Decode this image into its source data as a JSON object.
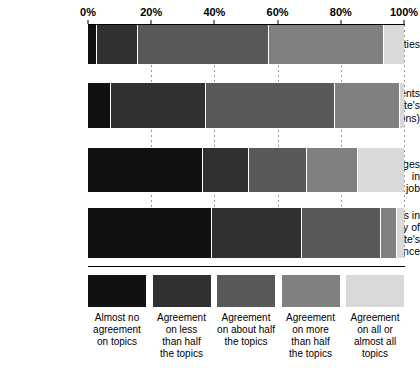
{
  "chart_data": {
    "type": "bar",
    "orientation": "horizontal",
    "stacked": true,
    "normalized_percent": true,
    "title": "",
    "xlabel": "",
    "ylabel": "",
    "xlim": [
      0,
      100
    ],
    "grid": true,
    "legend_position": "bottom",
    "x_tick_labels": [
      "0%",
      "20%",
      "40%",
      "60%",
      "80%",
      "100%"
    ],
    "x_tick_values": [
      0,
      20,
      40,
      60,
      80,
      100
    ],
    "categories": [
      "Job duties",
      "Job requirements (subordinate's qualifications)",
      "Future changes in subordinate's job",
      "Obstacles in the way of subordinate's performance"
    ],
    "category_lines": [
      [
        "Job duties"
      ],
      [
        "Job requirements",
        "(subordinate's",
        "qualifications)"
      ],
      [
        "Future changes in",
        "subordinate's job"
      ],
      [
        "Obstacles in",
        "the way of",
        "subordinate's",
        "performance"
      ]
    ],
    "series": [
      {
        "name": "Almost no agreement on topics",
        "color": "#111111",
        "values": [
          2.5,
          7.0,
          36.0,
          39.0
        ]
      },
      {
        "name": "Agreement on less than half the topics",
        "color": "#303030",
        "values": [
          13.0,
          30.0,
          14.5,
          28.5
        ]
      },
      {
        "name": "Agreement on about half the topics",
        "color": "#595959",
        "values": [
          41.5,
          41.0,
          18.5,
          25.0
        ]
      },
      {
        "name": "Agreement on more than half the topics",
        "color": "#808080",
        "values": [
          36.5,
          20.5,
          16.0,
          5.0
        ]
      },
      {
        "name": "Agreement on all or almost all topics",
        "color": "#d9d9d9",
        "values": [
          6.5,
          1.5,
          15.0,
          2.5
        ]
      }
    ]
  },
  "legend": {
    "items": [
      {
        "label_lines": [
          "Almost no",
          "agreement",
          "on topics"
        ],
        "color": "#111111"
      },
      {
        "label_lines": [
          "Agreement",
          "on less",
          "than half",
          "the topics"
        ],
        "color": "#303030"
      },
      {
        "label_lines": [
          "Agreement",
          "on about half",
          "the topics"
        ],
        "color": "#595959"
      },
      {
        "label_lines": [
          "Agreement",
          "on more",
          "than half",
          "the topics"
        ],
        "color": "#808080"
      },
      {
        "label_lines": [
          "Agreement",
          "on all or",
          "almost all",
          "topics"
        ],
        "color": "#d9d9d9"
      }
    ]
  }
}
